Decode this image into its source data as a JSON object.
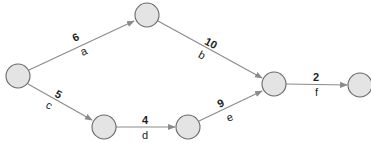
{
  "diagram": {
    "type": "activity-network",
    "nodes": [
      {
        "id": "n1",
        "cx": 18,
        "cy": 76
      },
      {
        "id": "n2",
        "cx": 147,
        "cy": 15
      },
      {
        "id": "n3",
        "cx": 104,
        "cy": 127
      },
      {
        "id": "n4",
        "cx": 188,
        "cy": 127
      },
      {
        "id": "n5",
        "cx": 274,
        "cy": 84
      },
      {
        "id": "n6",
        "cx": 360,
        "cy": 85
      }
    ],
    "edges": [
      {
        "from": "n1",
        "to": "n2",
        "weight": "6",
        "activity": "a"
      },
      {
        "from": "n2",
        "to": "n5",
        "weight": "10",
        "activity": "b"
      },
      {
        "from": "n1",
        "to": "n3",
        "weight": "5",
        "activity": "c"
      },
      {
        "from": "n3",
        "to": "n4",
        "weight": "4",
        "activity": "d"
      },
      {
        "from": "n4",
        "to": "n5",
        "weight": "9",
        "activity": "e"
      },
      {
        "from": "n5",
        "to": "n6",
        "weight": "2",
        "activity": "f"
      }
    ],
    "colors": {
      "node_fill": "#e4e4e4",
      "node_stroke": "#6a6a6a",
      "edge": "#8a8a8a",
      "text": "#222222"
    }
  }
}
